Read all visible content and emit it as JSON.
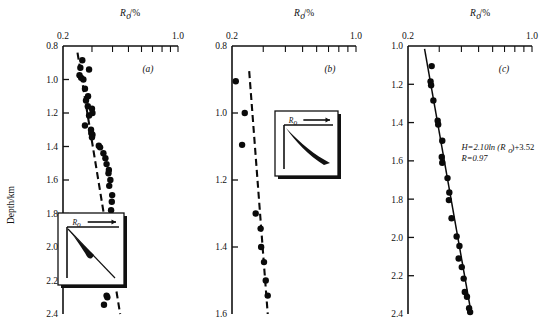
{
  "figure": {
    "y_axis_label": "Depth/km",
    "x_axis_label": "R",
    "x_axis_label_sub": "o",
    "x_axis_label_unit": "/%"
  },
  "chart_data": [
    {
      "type": "scatter",
      "panel": "(a)",
      "title": "Ro/%",
      "xlabel": "Ro/%",
      "ylabel": "Depth/km",
      "xscale": "log",
      "xlim": [
        0.2,
        1.0
      ],
      "xticks": [
        0.2,
        1.0
      ],
      "xticklabels": [
        "0.2",
        "1.0"
      ],
      "xminorticks": [
        0.3,
        0.4,
        0.5,
        0.6,
        0.7,
        0.8,
        0.9,
        1.0
      ],
      "ylim": [
        0.8,
        2.4
      ],
      "yticks": [
        0.8,
        1.0,
        1.2,
        1.4,
        1.6,
        1.8,
        2.0,
        2.2,
        2.4
      ],
      "yticklabels": [
        "0.8",
        "1.0",
        "1.2",
        "1.4",
        "1.6",
        "1.8",
        "2.0",
        "2.2",
        "2.4"
      ],
      "y_inverted": true,
      "grid": false,
      "trendline_style": "dashed",
      "trendline": [
        [
          0.245,
          0.84
        ],
        [
          0.445,
          2.4
        ]
      ],
      "points": [
        [
          0.262,
          0.885
        ],
        [
          0.255,
          0.93
        ],
        [
          0.288,
          0.94
        ],
        [
          0.252,
          0.975
        ],
        [
          0.258,
          0.99
        ],
        [
          0.266,
          1.0
        ],
        [
          0.272,
          1.055
        ],
        [
          0.284,
          1.1
        ],
        [
          0.276,
          1.125
        ],
        [
          0.283,
          1.16
        ],
        [
          0.3,
          1.175
        ],
        [
          0.302,
          1.2
        ],
        [
          0.288,
          1.215
        ],
        [
          0.272,
          1.275
        ],
        [
          0.296,
          1.3
        ],
        [
          0.297,
          1.32
        ],
        [
          0.302,
          1.33
        ],
        [
          0.3,
          1.345
        ],
        [
          0.33,
          1.395
        ],
        [
          0.336,
          1.405
        ],
        [
          0.352,
          1.44
        ],
        [
          0.362,
          1.47
        ],
        [
          0.368,
          1.505
        ],
        [
          0.38,
          1.54
        ],
        [
          0.378,
          1.56
        ],
        [
          0.388,
          1.6
        ],
        [
          0.382,
          1.635
        ],
        [
          0.398,
          1.69
        ],
        [
          0.396,
          1.73
        ],
        [
          0.392,
          1.78
        ],
        [
          0.398,
          1.83
        ],
        [
          0.386,
          1.89
        ],
        [
          0.382,
          1.955
        ],
        [
          0.372,
          2.06
        ],
        [
          0.362,
          2.095
        ],
        [
          0.352,
          2.165
        ],
        [
          0.368,
          2.29
        ],
        [
          0.372,
          2.3
        ],
        [
          0.355,
          2.345
        ]
      ],
      "inset": {
        "label": "R",
        "label_sub": "o",
        "arrow": "right",
        "shape": "narrow-wedge"
      }
    },
    {
      "type": "scatter",
      "panel": "(b)",
      "title": "Ro/%",
      "xlabel": "Ro/%",
      "ylabel": "Depth/km",
      "xscale": "log",
      "xlim": [
        0.2,
        1.0
      ],
      "xticks": [
        0.2,
        1.0
      ],
      "xticklabels": [
        "0.2",
        "1.0"
      ],
      "xminorticks": [
        0.3,
        0.4,
        0.5,
        0.6,
        0.7,
        0.8,
        0.9,
        1.0
      ],
      "ylim": [
        0.8,
        1.6
      ],
      "yticks": [
        0.8,
        1.0,
        1.2,
        1.4,
        1.6
      ],
      "yticklabels": [
        "0.8",
        "1.0",
        "1.2",
        "1.4",
        "1.6"
      ],
      "y_inverted": true,
      "grid": false,
      "trendline_style": "dashed",
      "trendline": [
        [
          0.25,
          0.875
        ],
        [
          0.318,
          1.6
        ]
      ],
      "points": [
        [
          0.21,
          0.905
        ],
        [
          0.236,
          1.0
        ],
        [
          0.228,
          1.095
        ],
        [
          0.272,
          1.3
        ],
        [
          0.29,
          1.345
        ],
        [
          0.292,
          1.4
        ],
        [
          0.303,
          1.445
        ],
        [
          0.31,
          1.5
        ],
        [
          0.318,
          1.545
        ]
      ],
      "inset": {
        "label": "R",
        "label_sub": "o",
        "arrow": "right",
        "shape": "broad-wedge"
      }
    },
    {
      "type": "scatter",
      "panel": "(c)",
      "title": "Ro/%",
      "xlabel": "Ro/%",
      "ylabel": "Depth/km",
      "xscale": "log",
      "xlim": [
        0.2,
        1.0
      ],
      "xticks": [
        0.2,
        1.0
      ],
      "xticklabels": [
        "0.2",
        "1.0"
      ],
      "xminorticks": [
        0.3,
        0.4,
        0.5,
        0.6,
        0.7,
        0.8,
        0.9,
        1.0
      ],
      "ylim": [
        1.0,
        2.4
      ],
      "yticks": [
        1.0,
        1.2,
        1.4,
        1.6,
        1.8,
        2.0,
        2.2,
        2.4
      ],
      "yticklabels": [
        "1.0",
        "1.2",
        "1.4",
        "1.6",
        "1.8",
        "2.0",
        "2.2",
        "2.4"
      ],
      "y_inverted": true,
      "grid": false,
      "trendline_style": "solid",
      "trendline": [
        [
          0.248,
          1.015
        ],
        [
          0.455,
          2.4
        ]
      ],
      "points": [
        [
          0.272,
          1.105
        ],
        [
          0.268,
          1.185
        ],
        [
          0.27,
          1.205
        ],
        [
          0.278,
          1.285
        ],
        [
          0.294,
          1.39
        ],
        [
          0.296,
          1.41
        ],
        [
          0.312,
          1.495
        ],
        [
          0.31,
          1.58
        ],
        [
          0.312,
          1.61
        ],
        [
          0.334,
          1.69
        ],
        [
          0.342,
          1.765
        ],
        [
          0.34,
          1.805
        ],
        [
          0.352,
          1.9
        ],
        [
          0.376,
          1.995
        ],
        [
          0.39,
          2.045
        ],
        [
          0.386,
          2.11
        ],
        [
          0.402,
          2.155
        ],
        [
          0.412,
          2.215
        ],
        [
          0.418,
          2.285
        ],
        [
          0.43,
          2.31
        ],
        [
          0.442,
          2.37
        ],
        [
          0.448,
          2.39
        ]
      ],
      "annotations": [
        {
          "text": "H=2.10ln (Ro)+3.52",
          "x": 0.4,
          "y": 1.545
        },
        {
          "text": "R=0.97",
          "x": 0.4,
          "y": 1.625
        }
      ],
      "equation_line1": "H=2.10ln (R",
      "equation_line1_sub": "o",
      "equation_line1_end": ")+3.52",
      "equation_line2": "R=0.97"
    }
  ]
}
